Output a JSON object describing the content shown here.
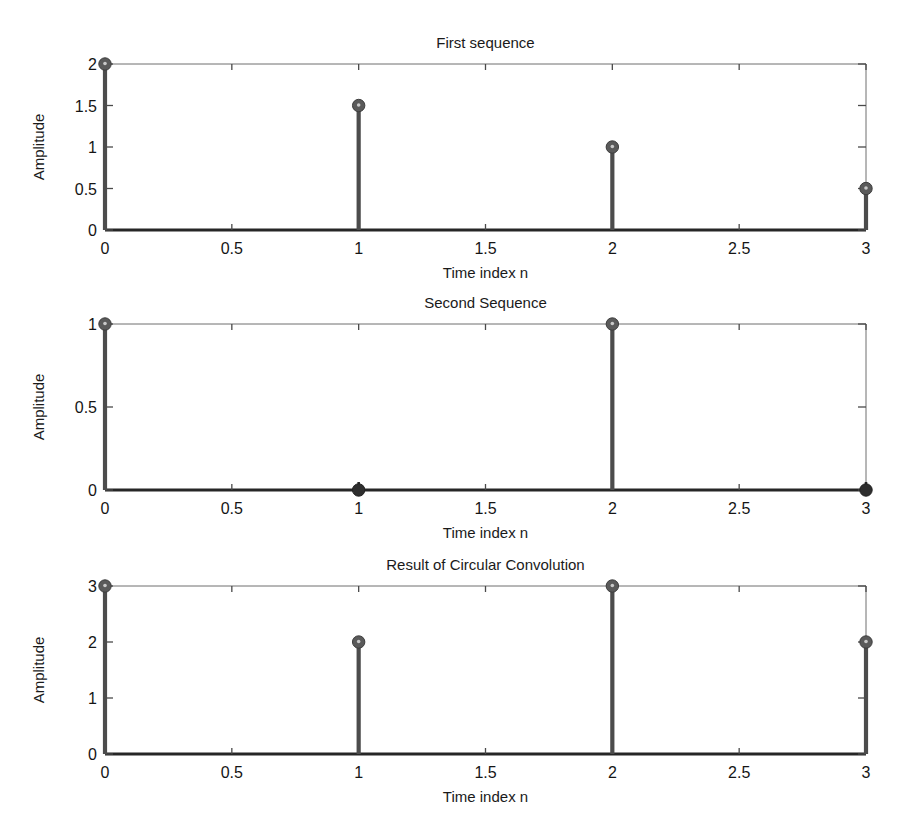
{
  "figure": {
    "background_color": "#ffffff",
    "stem_color": "#4c4c4c",
    "marker_color": "#5a5a5a",
    "axis_color": "#6e6e6e",
    "baseline_color": "#262626",
    "text_color": "#1a1a1a"
  },
  "chart_data": [
    {
      "type": "stem",
      "title": "First sequence",
      "xlabel": "Time index n",
      "ylabel": "Amplitude",
      "x": [
        0,
        1,
        2,
        3
      ],
      "values": [
        2,
        1.5,
        1,
        0.5
      ],
      "xlim": [
        0,
        3
      ],
      "ylim": [
        0,
        2
      ],
      "xticks": [
        0,
        0.5,
        1,
        1.5,
        2,
        2.5,
        3
      ],
      "xticklabels": [
        "0",
        "0.5",
        "1",
        "1.5",
        "2",
        "2.5",
        "3"
      ],
      "yticks": [
        0,
        0.5,
        1,
        1.5,
        2
      ],
      "yticklabels": [
        "0",
        "0.5",
        "1",
        "1.5",
        "2"
      ],
      "grid": false,
      "legend": null
    },
    {
      "type": "stem",
      "title": "Second Sequence",
      "xlabel": "Time index n",
      "ylabel": "Amplitude",
      "x": [
        0,
        1,
        2,
        3
      ],
      "values": [
        1,
        0,
        1,
        0
      ],
      "xlim": [
        0,
        3
      ],
      "ylim": [
        0,
        1
      ],
      "xticks": [
        0,
        0.5,
        1,
        1.5,
        2,
        2.5,
        3
      ],
      "xticklabels": [
        "0",
        "0.5",
        "1",
        "1.5",
        "2",
        "2.5",
        "3"
      ],
      "yticks": [
        0,
        0.5,
        1
      ],
      "yticklabels": [
        "0",
        "0.5",
        "1"
      ],
      "grid": false,
      "legend": null
    },
    {
      "type": "stem",
      "title": "Result of Circular Convolution",
      "xlabel": "Time index n",
      "ylabel": "Amplitude",
      "x": [
        0,
        1,
        2,
        3
      ],
      "values": [
        3,
        2,
        3,
        2
      ],
      "xlim": [
        0,
        3
      ],
      "ylim": [
        0,
        3
      ],
      "xticks": [
        0,
        0.5,
        1,
        1.5,
        2,
        2.5,
        3
      ],
      "xticklabels": [
        "0",
        "0.5",
        "1",
        "1.5",
        "2",
        "2.5",
        "3"
      ],
      "yticks": [
        0,
        1,
        2,
        3
      ],
      "yticklabels": [
        "0",
        "1",
        "2",
        "3"
      ],
      "grid": false,
      "legend": null
    }
  ]
}
